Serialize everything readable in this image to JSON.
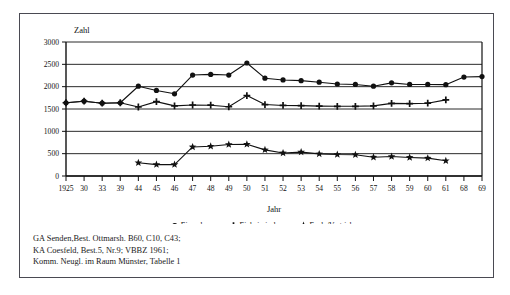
{
  "chart_data": {
    "type": "line",
    "title": "",
    "xlabel": "Jahr",
    "ylabel": "Zahl",
    "categories": [
      "1925",
      "30",
      "33",
      "39",
      "44",
      "45",
      "46",
      "47",
      "48",
      "49",
      "50",
      "51",
      "52",
      "53",
      "54",
      "55",
      "56",
      "57",
      "58",
      "59",
      "60",
      "61",
      "68",
      "69"
    ],
    "ylim": [
      0,
      3000
    ],
    "yticks": [
      0,
      500,
      1000,
      1500,
      2000,
      2500,
      3000
    ],
    "ytick_labels": [
      "0",
      "500",
      "1000",
      "1500",
      "2000",
      "2500",
      "3000"
    ],
    "grid": true,
    "legend_position": "bottom",
    "series": [
      {
        "name": "Einwohner",
        "marker": "circle",
        "values": [
          1640,
          1675,
          1630,
          1640,
          2010,
          1915,
          1840,
          2260,
          2275,
          2260,
          2530,
          2190,
          2150,
          2135,
          2100,
          2060,
          2050,
          2010,
          2085,
          2050,
          2050,
          2045,
          2215,
          2225
        ]
      },
      {
        "name": "Einheimische",
        "marker": "plus",
        "values": [
          1640,
          1675,
          1630,
          1640,
          1545,
          1665,
          1570,
          1590,
          1585,
          1550,
          1800,
          1600,
          1580,
          1575,
          1565,
          1560,
          1560,
          1570,
          1625,
          1620,
          1630,
          1705,
          null,
          null
        ]
      },
      {
        "name": "Evak./Vertriebene",
        "marker": "star",
        "values": [
          null,
          null,
          null,
          null,
          295,
          255,
          255,
          650,
          665,
          705,
          710,
          585,
          515,
          535,
          495,
          480,
          475,
          420,
          435,
          415,
          400,
          340,
          null,
          null
        ]
      }
    ]
  },
  "legend": {
    "items": [
      {
        "label": "Einwohner",
        "marker": "circle"
      },
      {
        "label": "Einheimische",
        "marker": "plus"
      },
      {
        "label": "Evak./Vertriebene",
        "marker": "star"
      }
    ]
  },
  "source_note": {
    "lines": [
      "GA Senden,Best. Ottmarsh. B60, C10, C43;",
      "KA Coesfeld, Best.5, Nr.9; VBBZ 1961;",
      "Komm. Neugl. im Raum Münster, Tabelle 1"
    ]
  },
  "colors": {
    "ink": "#111111",
    "frame": "#4a4a52",
    "background": "#ffffff",
    "gridline": "#2b2b2b"
  }
}
